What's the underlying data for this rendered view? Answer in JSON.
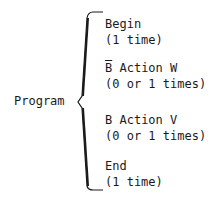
{
  "diagram": {
    "root": "Program",
    "items": [
      {
        "prefix": "",
        "label": "Begin",
        "count": "(1 time)"
      },
      {
        "prefix": "B",
        "prefix_negated": true,
        "label": " Action W",
        "count": "(0 or 1 times)"
      },
      {
        "prefix": "B",
        "prefix_negated": false,
        "label": " Action V",
        "count": "(0 or 1 times)"
      },
      {
        "prefix": "",
        "label": "End",
        "count": "(1 time)"
      }
    ]
  }
}
